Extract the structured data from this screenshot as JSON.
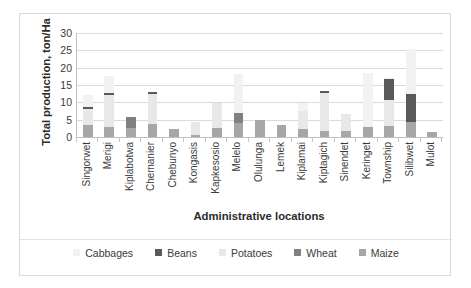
{
  "chart_data": {
    "type": "bar",
    "subtype": "stacked",
    "title": "",
    "xlabel": "Administrative locations",
    "ylabel": "Total production, ton/Ha",
    "ylim": [
      0,
      30
    ],
    "yticks": [
      0,
      5,
      10,
      15,
      20,
      25,
      30
    ],
    "grid": true,
    "legend_position": "bottom",
    "categories": [
      "Singorwet",
      "Merigi",
      "Kiplabotwa",
      "Chemanier",
      "Chebunyo",
      "Kongasis",
      "Kapkesosio",
      "Melelo",
      "Olulunga",
      "Lemek",
      "Kiplamai",
      "Kiptagich",
      "Sinendet",
      "Keringet",
      "Township",
      "Silibwet",
      "Mulot"
    ],
    "series": [
      {
        "name": "Maize",
        "color": "#a6a6a6",
        "values": [
          3.4,
          2.9,
          2.6,
          3.7,
          2.3,
          0.5,
          2.7,
          4.0,
          4.9,
          3.6,
          2.4,
          1.8,
          1.8,
          2.8,
          3.2,
          4.4,
          1.4
        ]
      },
      {
        "name": "Wheat",
        "color": "#808080",
        "values": [
          0.0,
          0.0,
          3.2,
          0.0,
          0.0,
          0.0,
          0.0,
          2.9,
          0.0,
          0.0,
          0.0,
          0.0,
          0.0,
          0.0,
          0.0,
          0.0,
          0.0
        ]
      },
      {
        "name": "Potatoes",
        "color": "#e8e8e8",
        "values": [
          4.7,
          9.3,
          0.0,
          8.7,
          0.0,
          3.7,
          7.0,
          0.0,
          0.0,
          0.0,
          5.2,
          11.0,
          4.9,
          0.0,
          7.6,
          0.0,
          0.0
        ]
      },
      {
        "name": "Beans",
        "color": "#595959",
        "values": [
          0.5,
          0.6,
          0.0,
          0.6,
          0.0,
          0.0,
          0.0,
          0.0,
          0.0,
          0.0,
          0.0,
          0.6,
          0.0,
          0.0,
          5.8,
          8.1,
          0.0
        ]
      },
      {
        "name": "Cabbages",
        "color": "#f2f2f2",
        "values": [
          3.6,
          4.8,
          0.0,
          0.0,
          0.0,
          0.0,
          0.0,
          11.2,
          0.0,
          0.0,
          2.3,
          0.0,
          0.0,
          15.8,
          0.4,
          12.8,
          0.0
        ]
      }
    ],
    "totals": [
      12.2,
      17.6,
      5.8,
      13.0,
      2.3,
      4.2,
      9.7,
      18.1,
      4.9,
      3.6,
      9.9,
      13.4,
      6.7,
      18.6,
      17.0,
      25.3,
      1.4
    ]
  },
  "legend": {
    "items": [
      {
        "label": "Cabbages",
        "color": "#f2f2f2"
      },
      {
        "label": "Beans",
        "color": "#595959"
      },
      {
        "label": "Potatoes",
        "color": "#e8e8e8"
      },
      {
        "label": "Wheat",
        "color": "#808080"
      },
      {
        "label": "Maize",
        "color": "#a6a6a6"
      }
    ]
  }
}
